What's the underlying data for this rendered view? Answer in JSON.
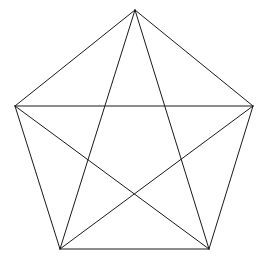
{
  "figure": {
    "background_color": "#ffffff",
    "line_color": "#1a1a1a",
    "line_width": 1,
    "canvas": {
      "width": 267,
      "height": 265
    }
  },
  "geometry": {
    "shape_type": "pentagon-with-pentagram",
    "vertex_count": 5,
    "edge_count": 5,
    "diagonal_count": 5,
    "total_segments": 10,
    "vertices": [
      {
        "id": "apex",
        "label": "A",
        "x": 135,
        "y": 10
      },
      {
        "id": "right",
        "label": "B",
        "x": 253,
        "y": 106
      },
      {
        "id": "bottom-right",
        "label": "C",
        "x": 209,
        "y": 249
      },
      {
        "id": "bottom-left",
        "label": "D",
        "x": 60,
        "y": 249
      },
      {
        "id": "left",
        "label": "E",
        "x": 15,
        "y": 106
      }
    ],
    "edges": [
      {
        "id": "edge-apex-right",
        "from": "apex",
        "to": "right",
        "x1": 135,
        "y1": 10,
        "x2": 253,
        "y2": 106
      },
      {
        "id": "edge-right-bottomright",
        "from": "right",
        "to": "bottom-right",
        "x1": 253,
        "y1": 106,
        "x2": 209,
        "y2": 249
      },
      {
        "id": "edge-bottomright-bottomleft",
        "from": "bottom-right",
        "to": "bottom-left",
        "x1": 209,
        "y1": 249,
        "x2": 60,
        "y2": 249
      },
      {
        "id": "edge-bottomleft-left",
        "from": "bottom-left",
        "to": "left",
        "x1": 60,
        "y1": 249,
        "x2": 15,
        "y2": 106
      },
      {
        "id": "edge-left-apex",
        "from": "left",
        "to": "apex",
        "x1": 15,
        "y1": 106,
        "x2": 135,
        "y2": 10
      }
    ],
    "diagonals": [
      {
        "id": "diagonal-apex-bottomright",
        "from": "apex",
        "to": "bottom-right",
        "x1": 135,
        "y1": 10,
        "x2": 209,
        "y2": 249
      },
      {
        "id": "diagonal-apex-bottomleft",
        "from": "apex",
        "to": "bottom-left",
        "x1": 135,
        "y1": 10,
        "x2": 60,
        "y2": 249
      },
      {
        "id": "diagonal-right-bottomleft",
        "from": "right",
        "to": "bottom-left",
        "x1": 253,
        "y1": 106,
        "x2": 60,
        "y2": 249
      },
      {
        "id": "diagonal-left-bottomright",
        "from": "left",
        "to": "bottom-right",
        "x1": 15,
        "y1": 106,
        "x2": 209,
        "y2": 249
      },
      {
        "id": "diagonal-left-right",
        "from": "left",
        "to": "right",
        "x1": 15,
        "y1": 106,
        "x2": 253,
        "y2": 106
      }
    ],
    "pentagon_path": "M 135,10 L 253,106 L 209,249 L 60,249 L 15,106 Z"
  }
}
